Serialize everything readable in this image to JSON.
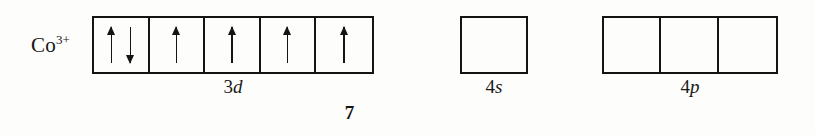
{
  "figure": {
    "page_number": "7",
    "ink_color": "#141414",
    "background_color": "#fdfdfc"
  },
  "species": {
    "symbol": "Co",
    "charge": "3+",
    "full_label": "Co3+"
  },
  "orbitals": [
    {
      "name": "3d",
      "principal": "3",
      "subshell": "d",
      "box_count": 5,
      "boxes": [
        {
          "electrons": [
            "up",
            "down"
          ]
        },
        {
          "electrons": [
            "up"
          ]
        },
        {
          "electrons": [
            "up"
          ]
        },
        {
          "electrons": [
            "up"
          ]
        },
        {
          "electrons": [
            "up"
          ]
        }
      ]
    },
    {
      "name": "4s",
      "principal": "4",
      "subshell": "s",
      "box_count": 1,
      "boxes": [
        {
          "electrons": []
        }
      ]
    },
    {
      "name": "4p",
      "principal": "4",
      "subshell": "p",
      "box_count": 3,
      "boxes": [
        {
          "electrons": []
        },
        {
          "electrons": []
        },
        {
          "electrons": []
        }
      ]
    }
  ],
  "icons": {
    "spin_up": "arrow-up-icon",
    "spin_down": "arrow-down-icon"
  }
}
